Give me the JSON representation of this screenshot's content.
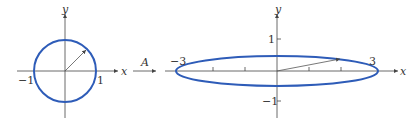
{
  "colors": {
    "curve": "#2e5cb8",
    "axis": "#444444",
    "text": "#333333"
  },
  "left_plot": {
    "title": "unit circle",
    "x_axis_label": "x",
    "y_axis_label": "y",
    "tick_labels": {
      "x_neg": "−1",
      "x_pos": "1"
    },
    "radius": 1
  },
  "transform": {
    "label": "A"
  },
  "right_plot": {
    "title": "ellipse image",
    "x_axis_label": "x",
    "y_axis_label": "y",
    "tick_labels": {
      "x_neg": "−3",
      "x_pos": "3",
      "y_pos": "1",
      "y_neg": "−1"
    },
    "semi_axes": {
      "x": 3,
      "y": 0.5
    }
  }
}
